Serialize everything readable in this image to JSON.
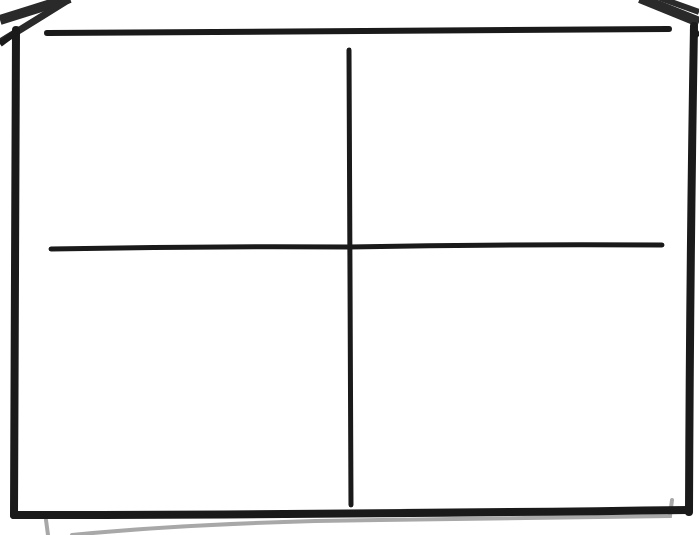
{
  "diagram": {
    "type": "quadrant-template",
    "style": "hand-drawn",
    "title_line": "",
    "quadrants": [
      {
        "position": "top-left",
        "label": ""
      },
      {
        "position": "top-right",
        "label": ""
      },
      {
        "position": "bottom-left",
        "label": ""
      },
      {
        "position": "bottom-right",
        "label": ""
      }
    ],
    "colors": {
      "background": "#ffffff",
      "stroke": "#1a1a1a",
      "shadow_page": "#a8a8a8",
      "roof_stroke": "#2a2a2a"
    }
  }
}
